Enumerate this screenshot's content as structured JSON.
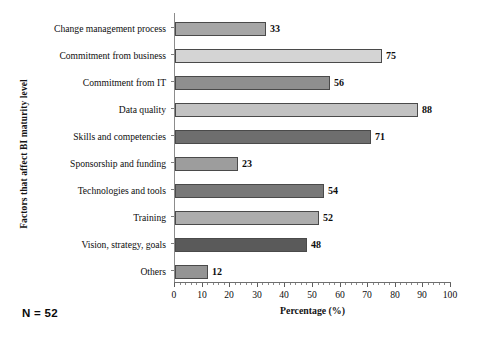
{
  "chart_data": {
    "type": "bar",
    "orientation": "horizontal",
    "title": "",
    "xlabel": "Percentage (%)",
    "ylabel": "Factors that affect BI maturity level",
    "xlim": [
      0,
      100
    ],
    "xticks": [
      0,
      10,
      20,
      30,
      40,
      50,
      60,
      70,
      80,
      90,
      100
    ],
    "xtick_labels": [
      "0",
      "10",
      "20",
      "30",
      "40",
      "50",
      "60",
      "70",
      "80",
      "90",
      "100"
    ],
    "minor_tick_step": 2,
    "grid": false,
    "legend": false,
    "categories": [
      "Change management process",
      "Commitment from business",
      "Commitment from IT",
      "Data quality",
      "Skills and competencies",
      "Sponsorship and funding",
      "Technologies and tools",
      "Training",
      "Vision, strategy, goals",
      "Others"
    ],
    "values": [
      33,
      75,
      56,
      88,
      71,
      23,
      54,
      52,
      48,
      12
    ],
    "value_labels": [
      "33",
      "75",
      "56",
      "88",
      "71",
      "23",
      "54",
      "52",
      "48",
      "12"
    ],
    "bar_colors": [
      "#a6a6a6",
      "#d4d4d4",
      "#8f8f8f",
      "#c2c2c2",
      "#6e6e6e",
      "#9d9d9d",
      "#787878",
      "#adadad",
      "#5a5a5a",
      "#949494"
    ],
    "bar_edge_color": "#4a4a4a",
    "axis_color": "#6e6e6e",
    "annotations": [
      {
        "name": "sample-size",
        "text": "N = 52"
      }
    ]
  },
  "footnote": {
    "sample_size": "N = 52"
  }
}
